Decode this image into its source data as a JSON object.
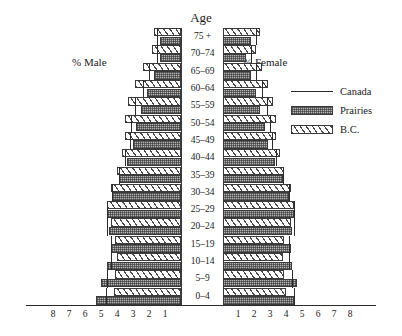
{
  "titles": {
    "age": "Age",
    "male": "% Male",
    "female": "% Female"
  },
  "legend": {
    "position": "right",
    "items": [
      {
        "label": "Canada",
        "style": "line"
      },
      {
        "label": "Prairies",
        "style": "dark-crosshatch"
      },
      {
        "label": "B.C.",
        "style": "diagonal-hatch"
      }
    ]
  },
  "axis": {
    "ticks_left": [
      "8",
      "7",
      "6",
      "5",
      "4",
      "3",
      "2",
      "1"
    ],
    "ticks_right": [
      "1",
      "2",
      "3",
      "4",
      "5",
      "6",
      "7",
      "8"
    ],
    "max": 8,
    "unit": "percent"
  },
  "chart_data": {
    "type": "bar",
    "title": "Age",
    "subtitle": "Population pyramid — Canada, Prairies and B.C.",
    "xlabel": "% of population",
    "ylabel": "Age",
    "xlim": [
      -8,
      8
    ],
    "grid": false,
    "legend_position": "right",
    "categories": [
      "0–4",
      "5–9",
      "10–14",
      "15–19",
      "20–24",
      "25–29",
      "30–34",
      "35–39",
      "40–44",
      "45–49",
      "50–54",
      "55–59",
      "60–64",
      "65–69",
      "70–74",
      "75 +"
    ],
    "series": [
      {
        "name": "Prairies",
        "side": "male",
        "values": [
          5.3,
          5.0,
          4.6,
          4.4,
          4.5,
          4.6,
          4.3,
          3.9,
          3.4,
          3.0,
          2.8,
          2.5,
          2.1,
          1.7,
          1.3,
          1.3
        ]
      },
      {
        "name": "B.C.",
        "side": "male",
        "values": [
          4.2,
          4.1,
          4.0,
          4.1,
          4.4,
          4.6,
          4.4,
          4.0,
          3.7,
          3.5,
          3.5,
          3.3,
          2.9,
          2.4,
          1.8,
          1.7
        ]
      },
      {
        "name": "Canada",
        "side": "male",
        "values": [
          4.7,
          4.6,
          4.4,
          4.4,
          4.6,
          4.6,
          4.3,
          3.9,
          3.5,
          3.2,
          3.1,
          2.9,
          2.4,
          2.0,
          1.5,
          1.5
        ]
      },
      {
        "name": "Prairies",
        "side": "female",
        "values": [
          4.5,
          4.7,
          4.4,
          4.3,
          4.4,
          4.5,
          4.2,
          3.8,
          3.3,
          2.9,
          2.7,
          2.4,
          2.1,
          1.8,
          1.5,
          1.8
        ]
      },
      {
        "name": "B.C.",
        "side": "female",
        "values": [
          4.0,
          3.9,
          3.8,
          3.9,
          4.3,
          4.5,
          4.3,
          3.9,
          3.6,
          3.4,
          3.4,
          3.2,
          2.9,
          2.5,
          2.1,
          2.4
        ]
      },
      {
        "name": "Canada",
        "side": "female",
        "values": [
          4.5,
          4.4,
          4.2,
          4.2,
          4.5,
          4.5,
          4.2,
          3.8,
          3.4,
          3.1,
          3.0,
          2.8,
          2.5,
          2.1,
          1.8,
          2.1
        ]
      }
    ]
  }
}
